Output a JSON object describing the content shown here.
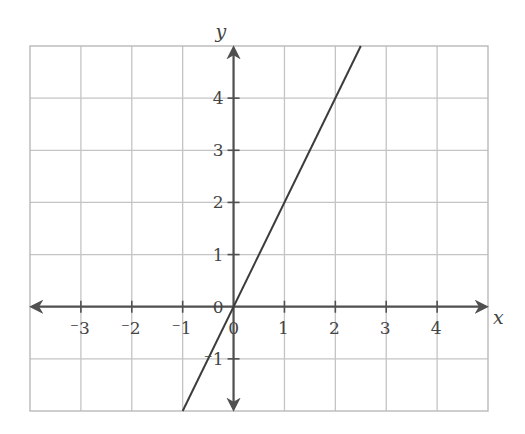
{
  "chart_data": {
    "type": "line",
    "title": "",
    "xlabel": "x",
    "ylabel": "y",
    "xlim": [
      -4,
      5
    ],
    "ylim": [
      -2,
      5
    ],
    "grid": true,
    "x_ticks": [
      -3,
      -2,
      -1,
      0,
      1,
      2,
      3,
      4
    ],
    "x_tick_labels": [
      "⁻3",
      "⁻2",
      "⁻1",
      "0",
      "1",
      "2",
      "3",
      "4"
    ],
    "y_ticks": [
      4,
      3,
      2,
      1,
      0,
      -1
    ],
    "y_tick_labels": [
      "4",
      "3",
      "2",
      "1",
      "0",
      "⁻1"
    ],
    "series": [
      {
        "name": "y = 2x",
        "equation": "y = 2x",
        "x": [
          -1,
          2.5
        ],
        "y": [
          -2,
          5
        ],
        "color": "#3c3c3c"
      }
    ],
    "legend": "none"
  },
  "colors": {
    "grid": "#c4c4c4",
    "axis": "#505050",
    "line": "#3c3c3c"
  }
}
